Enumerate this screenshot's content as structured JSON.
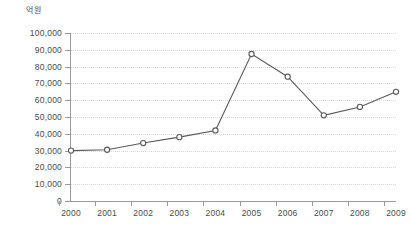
{
  "chart_data": {
    "type": "line",
    "title": "",
    "subtitle": "",
    "xlabel": "",
    "ylabel": "억원",
    "unit_label": "억원",
    "categories": [
      "2000",
      "2001",
      "2002",
      "2003",
      "2004",
      "2005",
      "2006",
      "2007",
      "2008",
      "2009"
    ],
    "values": [
      30000,
      30500,
      34500,
      38000,
      42000,
      87500,
      74000,
      51000,
      56000,
      65000
    ],
    "series": [
      {
        "name": "",
        "values": [
          30000,
          30500,
          34500,
          38000,
          42000,
          87500,
          74000,
          51000,
          56000,
          65000
        ]
      }
    ],
    "ylim": [
      0,
      100000
    ],
    "ytick_step": 10000,
    "ytick_labels": [
      "100,000",
      "90,000",
      "80,000",
      "70,000",
      "60,000",
      "50,000",
      "40,000",
      "30,000",
      "20,000",
      "10,000",
      "0"
    ],
    "ytick_values": [
      100000,
      90000,
      80000,
      70000,
      60000,
      50000,
      40000,
      30000,
      20000,
      10000,
      0
    ],
    "grid": true,
    "grid_axis": "y",
    "legend": false,
    "legend_position": "none",
    "marker": "open-circle",
    "colors": {
      "line": "#595959",
      "marker_fill": "#ffffff",
      "marker_stroke": "#595959",
      "grid": "#d8d8d8",
      "axis": "#9a9a9a",
      "text": "#4a4a4a",
      "background": "#ffffff"
    }
  }
}
